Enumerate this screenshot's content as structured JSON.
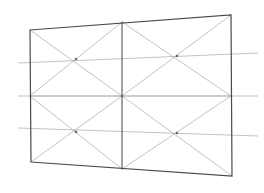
{
  "figure": {
    "type": "line-drawing",
    "background_color": "#ffffff",
    "canvas": {
      "width": 264,
      "height": 193
    }
  },
  "colors": {
    "frame_stroke": "#4a4a4a",
    "divider_stroke": "#555555",
    "diagonal_stroke": "#a8a8a8",
    "guide_stroke": "#b4b4b4",
    "node_fill": "#6b6b6b"
  },
  "strokes": {
    "frame_width": 1.2,
    "divider_width": 1.1,
    "diagonal_width": 0.7,
    "guide_width": 0.8
  },
  "quadrilateral": {
    "name": "outer-frame",
    "corners": {
      "top_left": {
        "x": 30,
        "y": 30
      },
      "top_right": {
        "x": 231,
        "y": 15
      },
      "bottom_right": {
        "x": 232,
        "y": 176
      },
      "bottom_left": {
        "x": 31,
        "y": 162
      }
    }
  },
  "edge_midpoints": {
    "top": {
      "x": 122,
      "y": 22
    },
    "bottom": {
      "x": 122,
      "y": 169
    },
    "left": {
      "x": 30,
      "y": 96
    },
    "right": {
      "x": 231,
      "y": 96
    }
  },
  "divider": {
    "name": "central-vertical-divider",
    "from": {
      "x": 122,
      "y": 22
    },
    "to": {
      "x": 122,
      "y": 169
    }
  },
  "quadrant_nodes": [
    {
      "name": "node-top-left",
      "x": 76,
      "y": 59
    },
    {
      "name": "node-top-right",
      "x": 177,
      "y": 56
    },
    {
      "name": "node-center",
      "x": 122,
      "y": 96
    },
    {
      "name": "node-bottom-left",
      "x": 76,
      "y": 132
    },
    {
      "name": "node-bottom-right",
      "x": 177,
      "y": 133
    }
  ],
  "quadrants": [
    {
      "name": "quadrant-top-left",
      "corners": [
        {
          "x": 30,
          "y": 30
        },
        {
          "x": 122,
          "y": 22
        },
        {
          "x": 122,
          "y": 96
        },
        {
          "x": 30,
          "y": 96
        }
      ]
    },
    {
      "name": "quadrant-top-right",
      "corners": [
        {
          "x": 122,
          "y": 22
        },
        {
          "x": 231,
          "y": 15
        },
        {
          "x": 231,
          "y": 96
        },
        {
          "x": 122,
          "y": 96
        }
      ]
    },
    {
      "name": "quadrant-bottom-left",
      "corners": [
        {
          "x": 30,
          "y": 96
        },
        {
          "x": 122,
          "y": 96
        },
        {
          "x": 122,
          "y": 169
        },
        {
          "x": 31,
          "y": 162
        }
      ]
    },
    {
      "name": "quadrant-bottom-right",
      "corners": [
        {
          "x": 122,
          "y": 96
        },
        {
          "x": 231,
          "y": 96
        },
        {
          "x": 232,
          "y": 176
        },
        {
          "x": 122,
          "y": 169
        }
      ]
    }
  ],
  "guide_lines": [
    {
      "name": "guide-line-upper",
      "from": {
        "x": 18,
        "y": 63
      },
      "to": {
        "x": 258,
        "y": 53
      }
    },
    {
      "name": "guide-line-middle",
      "from": {
        "x": 18,
        "y": 96
      },
      "to": {
        "x": 258,
        "y": 96
      }
    },
    {
      "name": "guide-line-lower",
      "from": {
        "x": 18,
        "y": 128
      },
      "to": {
        "x": 258,
        "y": 136
      }
    }
  ],
  "chart_data": {
    "type": "line",
    "xlabel": "",
    "ylabel": "",
    "xlim": [
      0,
      264
    ],
    "ylim": [
      193,
      0
    ],
    "grid": false,
    "legend": "none",
    "annotations": [],
    "series": [
      {
        "name": "outer-frame",
        "closed": true,
        "x": [
          30,
          231,
          232,
          31
        ],
        "y": [
          30,
          15,
          176,
          162
        ]
      },
      {
        "name": "central-vertical-divider",
        "closed": false,
        "x": [
          122,
          122
        ],
        "y": [
          22,
          169
        ]
      },
      {
        "name": "horizontal-midline",
        "closed": false,
        "x": [
          30,
          231
        ],
        "y": [
          96,
          96
        ]
      },
      {
        "name": "quadrant-top-left-diagonal-a",
        "closed": false,
        "x": [
          30,
          122
        ],
        "y": [
          30,
          96
        ]
      },
      {
        "name": "quadrant-top-left-diagonal-b",
        "closed": false,
        "x": [
          122,
          30
        ],
        "y": [
          22,
          96
        ]
      },
      {
        "name": "quadrant-top-right-diagonal-a",
        "closed": false,
        "x": [
          122,
          231
        ],
        "y": [
          22,
          96
        ]
      },
      {
        "name": "quadrant-top-right-diagonal-b",
        "closed": false,
        "x": [
          231,
          122
        ],
        "y": [
          15,
          96
        ]
      },
      {
        "name": "quadrant-bottom-left-diagonal-a",
        "closed": false,
        "x": [
          30,
          122
        ],
        "y": [
          96,
          169
        ]
      },
      {
        "name": "quadrant-bottom-left-diagonal-b",
        "closed": false,
        "x": [
          122,
          31
        ],
        "y": [
          96,
          162
        ]
      },
      {
        "name": "quadrant-bottom-right-diagonal-a",
        "closed": false,
        "x": [
          122,
          232
        ],
        "y": [
          96,
          176
        ]
      },
      {
        "name": "quadrant-bottom-right-diagonal-b",
        "closed": false,
        "x": [
          231,
          122
        ],
        "y": [
          96,
          169
        ]
      },
      {
        "name": "guide-line-upper",
        "closed": false,
        "x": [
          18,
          258
        ],
        "y": [
          63,
          53
        ]
      },
      {
        "name": "guide-line-middle",
        "closed": false,
        "x": [
          18,
          258
        ],
        "y": [
          96,
          96
        ]
      },
      {
        "name": "guide-line-lower",
        "closed": false,
        "x": [
          18,
          258
        ],
        "y": [
          128,
          136
        ]
      }
    ]
  }
}
